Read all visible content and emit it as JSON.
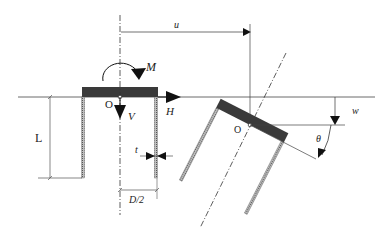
{
  "diagram": {
    "type": "engineering-schematic",
    "labels": {
      "moment": "M",
      "vertical_load": "V",
      "horizontal_load": "H",
      "origin_initial": "O",
      "origin_displaced": "O",
      "skirt_length": "L",
      "wall_thickness": "t",
      "half_diameter": "D/2",
      "horizontal_displacement": "u",
      "vertical_displacement": "w",
      "rotation": "θ"
    },
    "colors": {
      "lid": "#3a3a3a",
      "line": "#333333",
      "skirt_hatch": "#888888",
      "background": "#ffffff"
    }
  }
}
